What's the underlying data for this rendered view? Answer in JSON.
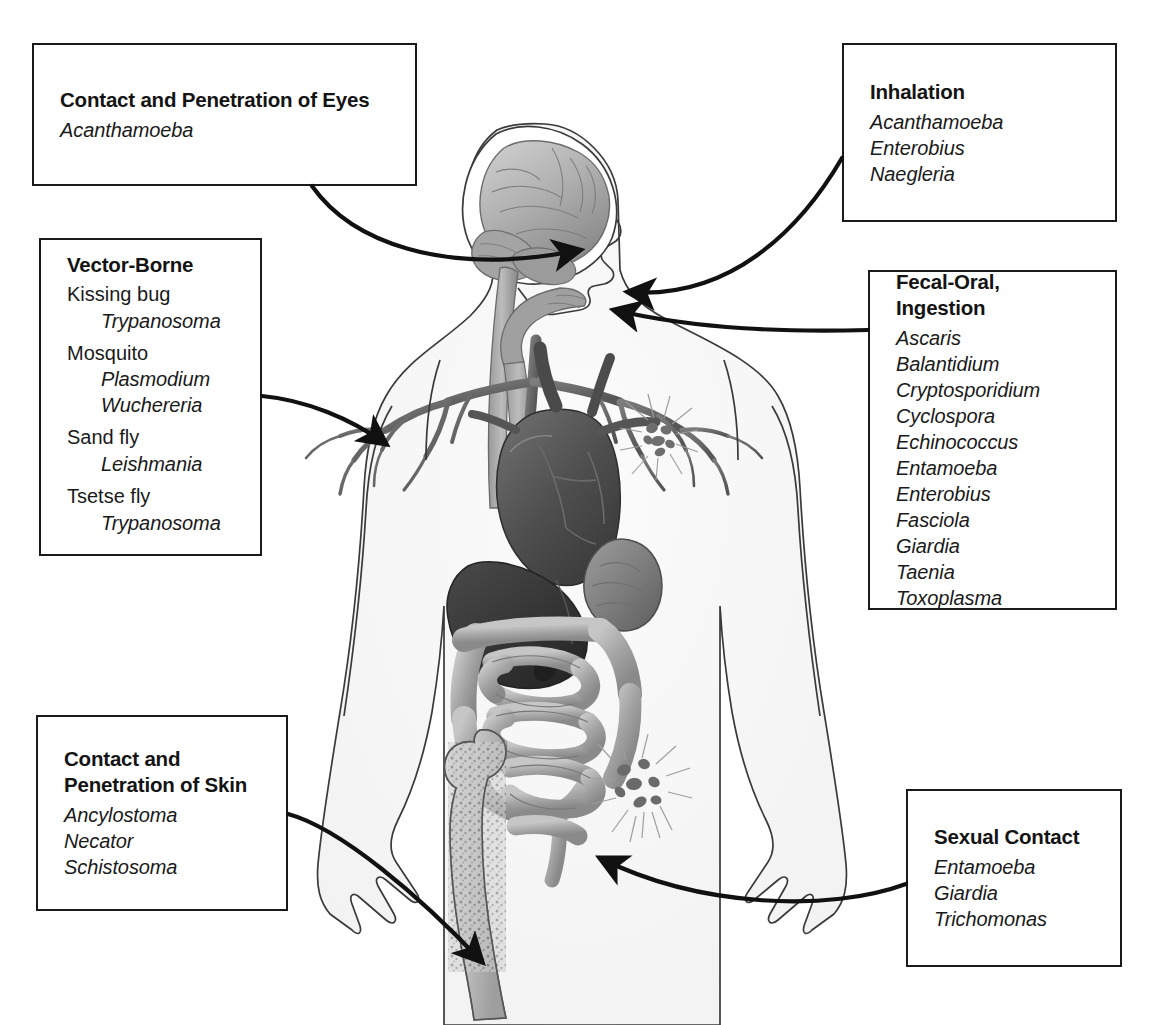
{
  "figure": {
    "illustration_label": "human-body-anatomy-illustration"
  },
  "callouts": [
    {
      "id": "eyes",
      "title": "Contact and Penetration of Eyes",
      "species": [
        "Acanthamoeba"
      ],
      "target": "eye"
    },
    {
      "id": "vector_borne",
      "title": "Vector-Borne",
      "vectors": [
        {
          "vector": "Kissing bug",
          "species": [
            "Trypanosoma"
          ]
        },
        {
          "vector": "Mosquito",
          "species": [
            "Plasmodium",
            "Wuchereria"
          ]
        },
        {
          "vector": "Sand fly",
          "species": [
            "Leishmania"
          ]
        },
        {
          "vector": "Tsetse fly",
          "species": [
            "Trypanosoma"
          ]
        }
      ],
      "target": "shoulder-bloodstream"
    },
    {
      "id": "skin",
      "title": "Contact and\nPenetration of Skin",
      "species": [
        "Ancylostoma",
        "Necator",
        "Schistosoma"
      ],
      "target": "leg-skin"
    },
    {
      "id": "inhalation",
      "title": "Inhalation",
      "species": [
        "Acanthamoeba",
        "Enterobius",
        "Naegleria"
      ],
      "target": "nose"
    },
    {
      "id": "fecal_oral",
      "title": "Fecal-Oral, Ingestion",
      "species": [
        "Ascaris",
        "Balantidium",
        "Cryptosporidium",
        "Cyclospora",
        "Echinococcus",
        "Entamoeba",
        "Enterobius",
        "Fasciola",
        "Giardia",
        "Taenia",
        "Toxoplasma"
      ],
      "target": "mouth"
    },
    {
      "id": "sexual_contact",
      "title": "Sexual Contact",
      "species": [
        "Entamoeba",
        "Giardia",
        "Trichomonas"
      ],
      "target": "pelvis"
    }
  ],
  "anatomy_parts": [
    "brain",
    "cerebellum",
    "spinal-cord",
    "face-profile",
    "pharynx",
    "esophagus",
    "bronchial-tree",
    "heart",
    "liver",
    "stomach",
    "small-intestine",
    "large-intestine",
    "femur",
    "parasite-cluster-chest",
    "parasite-cluster-pelvis"
  ],
  "colors": {
    "line": "#1a1a1a",
    "text": "#1a1a1a",
    "background": "#ffffff",
    "organ_light": "#b9b9b9",
    "organ_mid": "#8e8e8e",
    "organ_dark": "#5a5a5a",
    "organ_darkest": "#3d3d3d"
  }
}
